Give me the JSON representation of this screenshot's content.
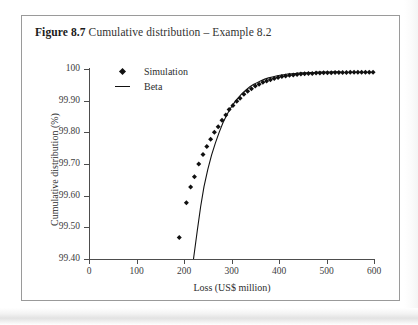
{
  "figure": {
    "label": "Figure 8.7",
    "caption": "Cumulative distribution – Example 8.2"
  },
  "colors": {
    "marker": "#111111",
    "curve": "#111111",
    "axis": "#4d4d4d",
    "frame": "#9a9a9a",
    "background": "#ffffff"
  },
  "chart_data": {
    "type": "scatter",
    "title": "Cumulative distribution – Example 8.2",
    "xlabel": "Loss (US$ million)",
    "ylabel": "Cumulative distribution (%)",
    "xlim": [
      0,
      600
    ],
    "ylim": [
      99.4,
      100.0
    ],
    "xticks": [
      0,
      100,
      200,
      300,
      400,
      500,
      600
    ],
    "xtick_labels": [
      "0",
      "100",
      "200",
      "300",
      "400",
      "500",
      "600"
    ],
    "yticks": [
      99.4,
      99.5,
      99.6,
      99.7,
      99.8,
      99.9,
      100.0
    ],
    "ytick_labels": [
      "99.40",
      "99.50",
      "99.60",
      "99.70",
      "99.80",
      "99.90",
      "100"
    ],
    "grid": false,
    "legend_position": "upper-left-inside",
    "series": [
      {
        "name": "Simulation",
        "type": "scatter",
        "marker": "diamond",
        "color": "#111111",
        "points": [
          [
            190,
            99.468
          ],
          [
            205,
            99.578
          ],
          [
            214,
            99.627
          ],
          [
            222,
            99.66
          ],
          [
            231,
            99.7
          ],
          [
            240,
            99.73
          ],
          [
            248,
            99.755
          ],
          [
            256,
            99.778
          ],
          [
            264,
            99.8
          ],
          [
            272,
            99.818
          ],
          [
            280,
            99.838
          ],
          [
            288,
            99.855
          ],
          [
            295,
            99.872
          ],
          [
            303,
            99.885
          ],
          [
            311,
            99.898
          ],
          [
            318,
            99.908
          ],
          [
            326,
            99.92
          ],
          [
            334,
            99.93
          ],
          [
            342,
            99.938
          ],
          [
            350,
            99.946
          ],
          [
            358,
            99.952
          ],
          [
            366,
            99.958
          ],
          [
            374,
            99.962
          ],
          [
            382,
            99.966
          ],
          [
            390,
            99.97
          ],
          [
            398,
            99.973
          ],
          [
            406,
            99.976
          ],
          [
            414,
            99.978
          ],
          [
            422,
            99.98
          ],
          [
            430,
            99.981
          ],
          [
            438,
            99.983
          ],
          [
            446,
            99.984
          ],
          [
            454,
            99.985
          ],
          [
            462,
            99.986
          ],
          [
            470,
            99.986
          ],
          [
            478,
            99.987
          ],
          [
            486,
            99.987
          ],
          [
            494,
            99.988
          ],
          [
            502,
            99.988
          ],
          [
            510,
            99.988
          ],
          [
            518,
            99.989
          ],
          [
            526,
            99.989
          ],
          [
            534,
            99.989
          ],
          [
            542,
            99.989
          ],
          [
            550,
            99.99
          ],
          [
            558,
            99.99
          ],
          [
            566,
            99.99
          ],
          [
            574,
            99.99
          ],
          [
            582,
            99.99
          ],
          [
            590,
            99.99
          ],
          [
            598,
            99.99
          ]
        ]
      },
      {
        "name": "Beta",
        "type": "line",
        "color": "#111111",
        "points": [
          [
            220,
            99.4
          ],
          [
            228,
            99.49
          ],
          [
            235,
            99.565
          ],
          [
            242,
            99.628
          ],
          [
            250,
            99.682
          ],
          [
            258,
            99.728
          ],
          [
            266,
            99.766
          ],
          [
            274,
            99.8
          ],
          [
            282,
            99.83
          ],
          [
            290,
            99.855
          ],
          [
            298,
            99.876
          ],
          [
            306,
            99.894
          ],
          [
            314,
            99.909
          ],
          [
            322,
            99.922
          ],
          [
            330,
            99.933
          ],
          [
            338,
            99.943
          ],
          [
            346,
            99.951
          ],
          [
            354,
            99.957
          ],
          [
            362,
            99.963
          ],
          [
            370,
            99.968
          ],
          [
            378,
            99.972
          ],
          [
            386,
            99.975
          ],
          [
            394,
            99.978
          ],
          [
            402,
            99.98
          ],
          [
            410,
            99.982
          ],
          [
            418,
            99.984
          ],
          [
            426,
            99.985
          ],
          [
            434,
            99.986
          ],
          [
            442,
            99.987
          ],
          [
            450,
            99.988
          ],
          [
            458,
            99.988
          ],
          [
            466,
            99.989
          ],
          [
            474,
            99.989
          ],
          [
            482,
            99.99
          ],
          [
            490,
            99.99
          ],
          [
            498,
            99.99
          ],
          [
            506,
            99.99
          ],
          [
            514,
            99.991
          ],
          [
            522,
            99.991
          ],
          [
            530,
            99.991
          ]
        ]
      }
    ]
  },
  "legend": {
    "items": [
      {
        "label": "Simulation",
        "key": "diamond-marker"
      },
      {
        "label": "Beta",
        "key": "line-segment"
      }
    ]
  }
}
